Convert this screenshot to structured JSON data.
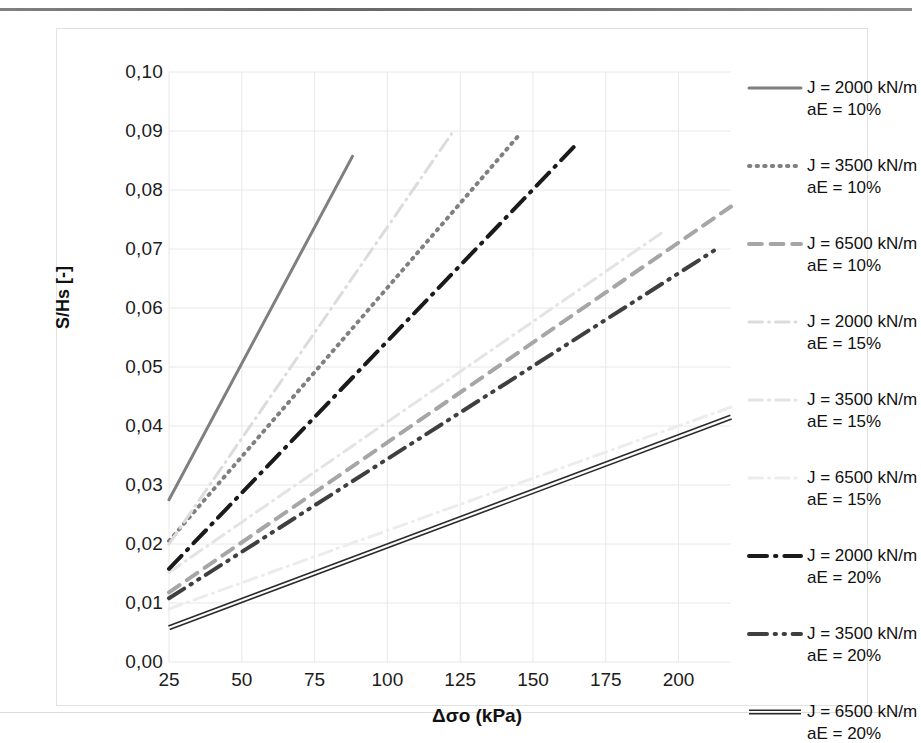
{
  "chart_data": {
    "type": "line",
    "title": "",
    "xlabel": "Δσo (kPa)",
    "ylabel": "S/Hs [-]",
    "xlim": [
      25,
      218
    ],
    "ylim": [
      0.0,
      0.1
    ],
    "xticks": [
      "25",
      "50",
      "75",
      "100",
      "125",
      "150",
      "175",
      "200"
    ],
    "xtick_values": [
      25,
      50,
      75,
      100,
      125,
      150,
      175,
      200
    ],
    "yticks": [
      "0,00",
      "0,01",
      "0,02",
      "0,03",
      "0,04",
      "0,05",
      "0,06",
      "0,07",
      "0,08",
      "0,09",
      "0,10"
    ],
    "ytick_values": [
      0.0,
      0.01,
      0.02,
      0.03,
      0.04,
      0.05,
      0.06,
      0.07,
      0.08,
      0.09,
      0.1
    ],
    "grid": true,
    "legend_position": "right",
    "series": [
      {
        "name": "J = 2000 kN/m\naE = 10%",
        "label_line1": "J = 2000 kN/m",
        "label_line2": "aE = 10%",
        "style": "solid",
        "color": "#7f7f7f",
        "width": 3,
        "x": [
          25,
          88
        ],
        "y": [
          0.0275,
          0.0857
        ]
      },
      {
        "name": "J = 3500 kN/m\naE = 10%",
        "label_line1": "J = 3500 kN/m",
        "label_line2": "aE = 10%",
        "style": "dotted",
        "color": "#808080",
        "width": 4,
        "x": [
          25,
          145
        ],
        "y": [
          0.0205,
          0.0892
        ]
      },
      {
        "name": "J = 6500 kN/m\naE = 10%",
        "label_line1": "J = 6500 kN/m",
        "label_line2": "aE = 10%",
        "style": "dashed",
        "color": "#a6a6a6",
        "width": 4,
        "x": [
          25,
          218
        ],
        "y": [
          0.0118,
          0.0772
        ]
      },
      {
        "name": "J = 2000 kN/m\naE = 15%",
        "label_line1": "J = 2000 kN/m",
        "label_line2": "aE = 15%",
        "style": "dashdot",
        "color": "#dcdcdc",
        "width": 3,
        "x": [
          25,
          122
        ],
        "y": [
          0.02,
          0.0895
        ]
      },
      {
        "name": "J = 3500 kN/m\naE = 15%",
        "label_line1": "J = 3500 kN/m",
        "label_line2": "aE = 15%",
        "style": "dashdot",
        "color": "#e4e4e4",
        "width": 3,
        "x": [
          25,
          195
        ],
        "y": [
          0.0152,
          0.073
        ]
      },
      {
        "name": "J = 6500 kN/m\naE = 15%",
        "label_line1": "J = 6500 kN/m",
        "label_line2": "aE = 15%",
        "style": "dashdot",
        "color": "#ececec",
        "width": 3,
        "x": [
          25,
          218
        ],
        "y": [
          0.009,
          0.0432
        ]
      },
      {
        "name": "J = 2000 kN/m\naE = 20%",
        "label_line1": "J = 2000 kN/m",
        "label_line2": "aE = 20%",
        "style": "dashdot",
        "color": "#1a1a1a",
        "width": 4,
        "x": [
          25,
          165
        ],
        "y": [
          0.0158,
          0.0878
        ]
      },
      {
        "name": "J = 3500 kN/m\naE = 20%",
        "label_line1": "J = 3500 kN/m",
        "label_line2": "aE = 20%",
        "style": "dashdotdot",
        "color": "#3f3f3f",
        "width": 4,
        "x": [
          25,
          214
        ],
        "y": [
          0.0108,
          0.0703
        ]
      },
      {
        "name": "J = 6500 kN/m\naE = 20%",
        "label_line1": "J = 6500 kN/m",
        "label_line2": "aE = 20%",
        "style": "double",
        "color": "#2b2b2b",
        "width": 3,
        "x": [
          25,
          218
        ],
        "y": [
          0.0058,
          0.0415
        ]
      }
    ]
  },
  "axes": {
    "x_title": "Δσo (kPa)",
    "y_title": "S/Hs [-]"
  },
  "legend": {
    "items": [
      {
        "line1": "J = 2000 kN/m",
        "line2": "aE = 10%"
      },
      {
        "line1": "J = 3500 kN/m",
        "line2": "aE = 10%"
      },
      {
        "line1": "J = 6500 kN/m",
        "line2": "aE = 10%"
      },
      {
        "line1": "J = 2000 kN/m",
        "line2": "aE = 15%"
      },
      {
        "line1": "J = 3500 kN/m",
        "line2": "aE = 15%"
      },
      {
        "line1": "J = 6500 kN/m",
        "line2": "aE = 15%"
      },
      {
        "line1": "J = 2000 kN/m",
        "line2": "aE = 20%"
      },
      {
        "line1": "J = 3500 kN/m",
        "line2": "aE = 20%"
      },
      {
        "line1": "J = 6500 kN/m",
        "line2": "aE = 20%"
      }
    ]
  },
  "colors": {
    "grid": "#e8e8e8",
    "frame": "#e2e2e2",
    "text": "#1c1c1c"
  }
}
